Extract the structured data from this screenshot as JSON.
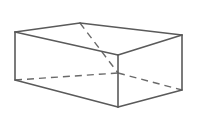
{
  "figure": {
    "shape_type": "rectangular-prism",
    "background_color": "#ffffff",
    "visible_edge_color": "#5a5a5a",
    "hidden_edge_color": "#6a6a6a",
    "visible_edge_width": 1.6,
    "hidden_edge_width": 1.4,
    "hidden_dash_pattern": "7 5",
    "canvas": {
      "width": 201,
      "height": 122
    },
    "vertices": {
      "top_back_left": [
        15,
        32
      ],
      "top_back_right": [
        80,
        23
      ],
      "top_front_right": [
        182,
        35
      ],
      "top_front_left": [
        118,
        55
      ],
      "bottom_back_left": [
        15,
        80
      ],
      "bottom_back_right": [
        118,
        73
      ],
      "bottom_front_right": [
        182,
        90
      ],
      "bottom_front_left": [
        118,
        107
      ]
    },
    "edges_visible": [
      {
        "name": "top-rim-back-left",
        "from": "top_back_left",
        "to": "top_back_right"
      },
      {
        "name": "top-rim-back-right",
        "from": "top_back_right",
        "to": "top_front_right"
      },
      {
        "name": "top-rim-front-right",
        "from": "top_front_right",
        "to": "top_front_left"
      },
      {
        "name": "top-rim-front-left",
        "from": "top_front_left",
        "to": "top_back_left"
      },
      {
        "name": "vertical-left",
        "from": "top_back_left",
        "to": "bottom_back_left"
      },
      {
        "name": "vertical-front",
        "from": "top_front_left",
        "to": "bottom_front_left"
      },
      {
        "name": "vertical-right",
        "from": "top_front_right",
        "to": "bottom_front_right"
      },
      {
        "name": "bottom-front-left",
        "from": "bottom_back_left",
        "to": "bottom_front_left"
      },
      {
        "name": "bottom-front-right",
        "from": "bottom_front_left",
        "to": "bottom_front_right"
      }
    ],
    "edges_hidden": [
      {
        "name": "hidden-vertical-back",
        "from": "top_back_right",
        "to": "bottom_back_right"
      },
      {
        "name": "hidden-bottom-back-left",
        "from": "bottom_back_left",
        "to": "bottom_back_right"
      },
      {
        "name": "hidden-bottom-back-right",
        "from": "bottom_back_right",
        "to": "bottom_front_right"
      }
    ]
  }
}
